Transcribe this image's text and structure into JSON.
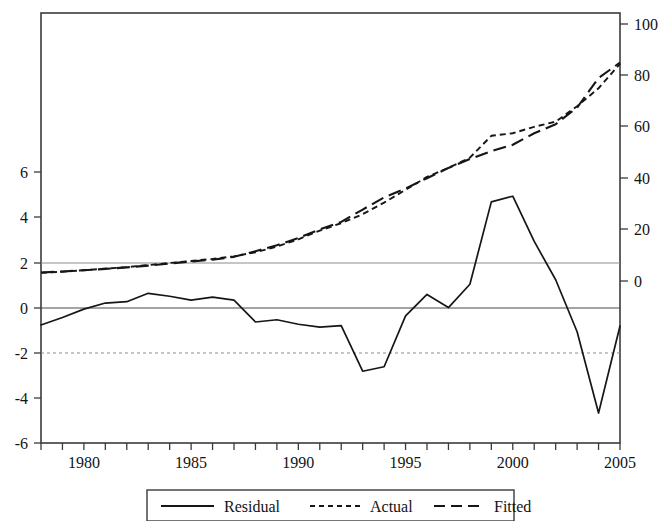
{
  "chart_data": {
    "type": "line",
    "title": "",
    "subtitle": "",
    "xlabel": "",
    "ylabel": "",
    "grid": false,
    "legend_position": "bottom",
    "x": [
      1978,
      1979,
      1980,
      1981,
      1982,
      1983,
      1984,
      1985,
      1986,
      1987,
      1988,
      1989,
      1990,
      1991,
      1992,
      1993,
      1994,
      1995,
      1996,
      1997,
      1998,
      1999,
      2000,
      2001,
      2002,
      2003,
      2004,
      2005
    ],
    "x_tick_labels": [
      "1980",
      "1985",
      "1990",
      "1995",
      "2000",
      "2005"
    ],
    "x_tick_values": [
      1980,
      1985,
      1990,
      1995,
      2000,
      2005
    ],
    "xlim": [
      1978,
      2005
    ],
    "left_axis": {
      "label": "",
      "ylim": [
        -6,
        7.5
      ],
      "tick_labels": [
        "6",
        "4",
        "2",
        "0",
        "-2",
        "-4",
        "-6"
      ],
      "tick_values": [
        6,
        4,
        2,
        0,
        -2,
        -4,
        -6
      ]
    },
    "right_axis": {
      "label": "",
      "ylim": [
        -11.7,
        100
      ],
      "tick_labels": [
        "100",
        "80",
        "60",
        "40",
        "20",
        "0"
      ],
      "tick_values": [
        100,
        80,
        60,
        40,
        20,
        0
      ]
    },
    "reference_lines": [
      {
        "name": "upper-band",
        "axis": "left",
        "value": 1.95,
        "style": "solid-light"
      },
      {
        "name": "zero-line",
        "axis": "left",
        "value": 0,
        "style": "solid"
      },
      {
        "name": "lower-band",
        "axis": "left",
        "value": -1.95,
        "style": "dotted-light"
      }
    ],
    "series": [
      {
        "name": "Residual",
        "axis": "left",
        "style": "solid",
        "values": [
          -0.75,
          -0.42,
          -0.05,
          0.22,
          0.28,
          0.65,
          0.52,
          0.35,
          0.48,
          0.35,
          -0.62,
          -0.52,
          -0.72,
          -0.85,
          -0.78,
          -2.8,
          -2.6,
          -0.35,
          0.6,
          0.02,
          1.05,
          4.7,
          4.95,
          2.95,
          1.25,
          -1.05,
          -4.65,
          -0.8
        ]
      },
      {
        "name": "Actual",
        "axis": "right",
        "style": "dotted",
        "values": [
          3.2,
          3.6,
          4.2,
          4.8,
          5.4,
          6.2,
          7.0,
          7.8,
          8.6,
          9.6,
          11.2,
          13.4,
          16.2,
          19.6,
          22.5,
          26.0,
          30.5,
          35.5,
          40.5,
          44.0,
          48.0,
          56.5,
          57.5,
          60.0,
          62.0,
          68.0,
          75.0,
          84.5
        ]
      },
      {
        "name": "Fitted",
        "axis": "right",
        "style": "dashed",
        "values": [
          3.3,
          3.7,
          4.2,
          4.7,
          5.3,
          6.0,
          6.8,
          7.6,
          8.3,
          9.4,
          11.6,
          13.9,
          16.7,
          20.1,
          23.0,
          27.8,
          32.5,
          36.0,
          40.0,
          44.0,
          47.5,
          50.5,
          53.0,
          57.5,
          61.0,
          67.5,
          79.0,
          85.0
        ]
      }
    ]
  },
  "legend": {
    "entries": [
      {
        "label": "Residual",
        "style": "solid"
      },
      {
        "label": "Actual",
        "style": "dotted"
      },
      {
        "label": "Fitted",
        "style": "dashed"
      }
    ]
  }
}
